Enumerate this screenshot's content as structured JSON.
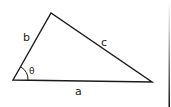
{
  "diagram": {
    "type": "triangle",
    "vertices": {
      "bottom_left": [
        13,
        80
      ],
      "top": [
        51,
        13
      ],
      "bottom_right": [
        152,
        82
      ]
    },
    "labels": {
      "side_a": "a",
      "side_b": "b",
      "side_c": "c",
      "angle": "θ"
    },
    "colors": {
      "stroke": "#1a1a1a",
      "text": "#222222",
      "background": "#ffffff"
    }
  }
}
